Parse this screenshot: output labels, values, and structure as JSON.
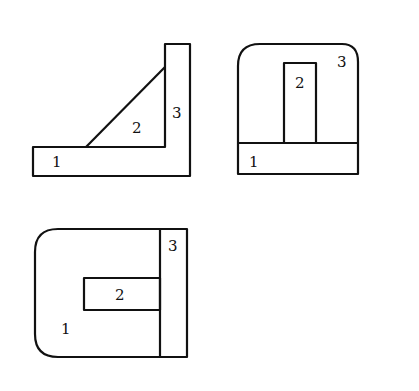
{
  "views": {
    "front": {
      "labels": [
        "1",
        "2",
        "3"
      ]
    },
    "side": {
      "labels": [
        "1",
        "2",
        "3"
      ]
    },
    "top": {
      "labels": [
        "1",
        "2",
        "3"
      ]
    }
  },
  "colors": {
    "stroke": "#111111",
    "background": "#ffffff"
  }
}
